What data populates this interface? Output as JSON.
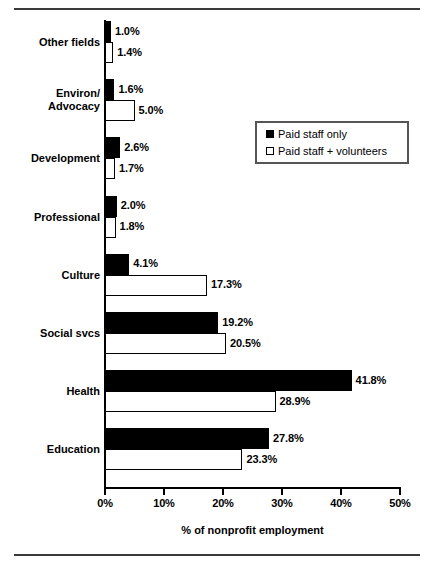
{
  "chart_data": {
    "type": "bar",
    "orientation": "horizontal",
    "title": "",
    "xlabel": "% of nonprofit employment",
    "ylabel": "",
    "xlim": [
      0,
      50
    ],
    "xticks": [
      "0%",
      "10%",
      "20%",
      "30%",
      "40%",
      "50%"
    ],
    "xtick_values": [
      0,
      10,
      20,
      30,
      40,
      50
    ],
    "grid": false,
    "legend_position": "upper-right-inside",
    "categories": [
      "Other fields",
      "Environ/ Advocacy",
      "Development",
      "Professional",
      "Culture",
      "Social svcs",
      "Health",
      "Education"
    ],
    "series": [
      {
        "name": "Paid staff only",
        "style": "solid-black",
        "values": [
          1.0,
          1.6,
          2.6,
          2.0,
          4.1,
          19.2,
          41.8,
          27.8
        ],
        "labels": [
          "1.0%",
          "1.6%",
          "2.6%",
          "2.0%",
          "4.1%",
          "19.2%",
          "41.8%",
          "27.8%"
        ]
      },
      {
        "name": "Paid staff + volunteers",
        "style": "hollow-white",
        "values": [
          1.4,
          5.0,
          1.7,
          1.8,
          17.3,
          20.5,
          28.9,
          23.3
        ],
        "labels": [
          "1.4%",
          "5.0%",
          "1.7%",
          "1.8%",
          "17.3%",
          "20.5%",
          "28.9%",
          "23.3%"
        ]
      }
    ]
  },
  "category_labels": [
    {
      "line1": "Other fields",
      "line2": ""
    },
    {
      "line1": "Environ/",
      "line2": "Advocacy"
    },
    {
      "line1": "Development",
      "line2": ""
    },
    {
      "line1": "Professional",
      "line2": ""
    },
    {
      "line1": "Culture",
      "line2": ""
    },
    {
      "line1": "Social svcs",
      "line2": ""
    },
    {
      "line1": "Health",
      "line2": ""
    },
    {
      "line1": "Education",
      "line2": ""
    }
  ],
  "legend": {
    "items": [
      {
        "label": "Paid staff only",
        "swatch": "filled-square-icon"
      },
      {
        "label": "Paid staff + volunteers",
        "swatch": "outlined-square-icon"
      }
    ]
  },
  "colors": {
    "series_1": "#000000",
    "series_2": "#ffffff",
    "axis": "#000000",
    "frame_rule": "#3a3a3a",
    "legend_border": "#555555",
    "background": "#ffffff"
  }
}
